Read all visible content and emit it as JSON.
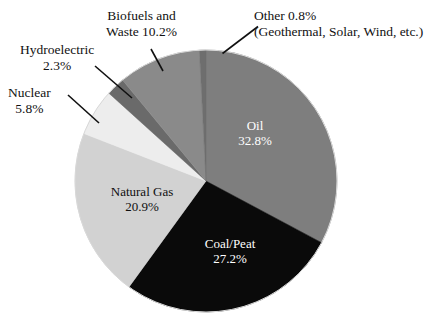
{
  "chart_data": {
    "type": "pie",
    "title": "",
    "subtitle": "",
    "xlabel": "",
    "ylabel": "",
    "legend_position": "none",
    "grid": false,
    "units": "percent",
    "start_angle_deg": 0,
    "direction": "clockwise",
    "center": {
      "x": 206,
      "y": 181
    },
    "radius": 131,
    "categories": [
      "Oil",
      "Coal/Peat",
      "Natural Gas",
      "Nuclear",
      "Hydroelectric",
      "Biofuels and Waste",
      "Other"
    ],
    "values": [
      32.8,
      27.2,
      20.9,
      5.8,
      2.3,
      10.2,
      0.8
    ],
    "slices": [
      {
        "name": "Oil",
        "label_line1": "Oil",
        "label_line2": "32.8%",
        "value": 32.8,
        "color": "#7e7e7e",
        "label_placement": "inside",
        "text_color": "#ffffff"
      },
      {
        "name": "Coal/Peat",
        "label_line1": "Coal/Peat",
        "label_line2": "27.2%",
        "value": 27.2,
        "color": "#0a0a0a",
        "label_placement": "inside",
        "text_color": "#ffffff"
      },
      {
        "name": "Natural Gas",
        "label_line1": "Natural Gas",
        "label_line2": "20.9%",
        "value": 20.9,
        "color": "#d2d2d2",
        "label_placement": "inside",
        "text_color": "#101010"
      },
      {
        "name": "Nuclear",
        "label_line1": "Nuclear",
        "label_line2": "5.8%",
        "value": 5.8,
        "color": "#ededed",
        "label_placement": "outside",
        "text_color": "#111111"
      },
      {
        "name": "Hydroelectric",
        "label_line1": "Hydroelectric",
        "label_line2": "2.3%",
        "value": 2.3,
        "color": "#6a6a6a",
        "label_placement": "outside",
        "text_color": "#111111"
      },
      {
        "name": "Biofuels and Waste",
        "label_line1": "Biofuels and",
        "label_line2": "Waste 10.2%",
        "value": 10.2,
        "color": "#8a8a8a",
        "label_placement": "outside",
        "text_color": "#111111"
      },
      {
        "name": "Other",
        "label_line1": "Other 0.8%",
        "label_line2": "(Geothermal, Solar, Wind, etc.)",
        "value": 0.8,
        "color": "#6e6e6e",
        "label_placement": "outside",
        "text_color": "#111111"
      }
    ],
    "colors": {
      "oil": "#7e7e7e",
      "coal_peat": "#0a0a0a",
      "natural_gas": "#d2d2d2",
      "nuclear": "#ededed",
      "hydroelectric": "#6a6a6a",
      "biofuels_waste": "#8a8a8a",
      "other": "#6e6e6e",
      "background": "#ffffff",
      "leader_line": "#111111",
      "outline": "#d8d8d8"
    }
  },
  "labels": {
    "oil": {
      "line1": "Oil",
      "line2": "32.8%"
    },
    "coal": {
      "line1": "Coal/Peat",
      "line2": "27.2%"
    },
    "gas": {
      "line1": "Natural Gas",
      "line2": "20.9%"
    },
    "nuclear": {
      "line1": "Nuclear",
      "line2": "5.8%"
    },
    "hydro": {
      "line1": "Hydroelectric",
      "line2": "2.3%"
    },
    "biofuels": {
      "line1": "Biofuels and",
      "line2": "Waste 10.2%"
    },
    "other": {
      "line1": "Other 0.8%",
      "line2": "(Geothermal, Solar, Wind, etc.)"
    }
  }
}
